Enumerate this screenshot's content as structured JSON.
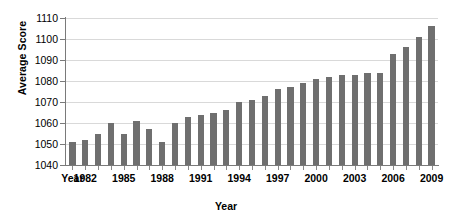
{
  "chart_data": {
    "type": "bar",
    "title": "",
    "xlabel": "Year",
    "ylabel": "Average Score",
    "ylim": [
      1040,
      1110
    ],
    "yticks": [
      1040,
      1050,
      1060,
      1070,
      1080,
      1090,
      1100,
      1110
    ],
    "ytick_labels": [
      "1040",
      "1050",
      "1060",
      "1070",
      "1080",
      "1090",
      "1100",
      "1110"
    ],
    "grid": true,
    "legend": "none",
    "bar_color": "#6f6f6f",
    "gridline_color": "#d9d9d9",
    "axis_color": "#7a7a7a",
    "first_xtick_label": "Year",
    "xtick_labels": [
      "Year",
      "1982",
      "1985",
      "1988",
      "1991",
      "1994",
      "1997",
      "2000",
      "2003",
      "2006",
      "2009"
    ],
    "xtick_years": [
      1981,
      1982,
      1985,
      1988,
      1991,
      1994,
      1997,
      2000,
      2003,
      2006,
      2009
    ],
    "categories": [
      "1981",
      "1982",
      "1983",
      "1984",
      "1985",
      "1986",
      "1987",
      "1988",
      "1989",
      "1990",
      "1991",
      "1992",
      "1993",
      "1994",
      "1995",
      "1996",
      "1997",
      "1998",
      "1999",
      "2000",
      "2001",
      "2002",
      "2003",
      "2004",
      "2005",
      "2006",
      "2007",
      "2008",
      "2009"
    ],
    "values": [
      1051,
      1052,
      1055,
      1060,
      1055,
      1061,
      1057,
      1051,
      1060,
      1063,
      1064,
      1065,
      1066,
      1070,
      1071,
      1073,
      1076,
      1077,
      1079,
      1081,
      1082,
      1083,
      1083,
      1084,
      1084,
      1093,
      1096,
      1101,
      1106
    ]
  }
}
